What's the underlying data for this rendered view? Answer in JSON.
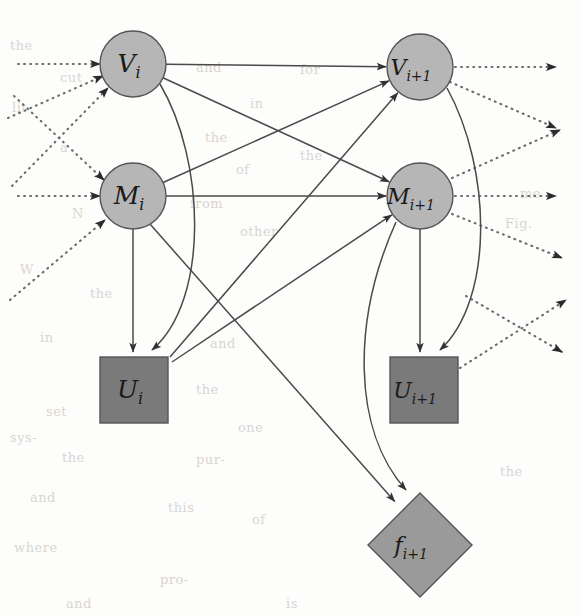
{
  "figure": {
    "background_color": "#fdfdfc",
    "colors": {
      "chance_node_fill": "#b6b6b6",
      "decision_node_fill": "#7a7a7a",
      "utility_node_fill": "#9a9a9a",
      "node_stroke": "#555555",
      "solid_edge": "#4a4a4a",
      "dotted_edge": "#6b6b6b",
      "label_text": "#1a1a1a",
      "bleed_text": "#d9d6d0"
    },
    "nodes": [
      {
        "id": "V_i",
        "label": "V",
        "sub": "i",
        "shape": "circle",
        "cx": 133,
        "cy": 64,
        "r": 33,
        "fill_key": "chance_node_fill"
      },
      {
        "id": "V_i1",
        "label": "V",
        "sub": "i+1",
        "shape": "circle",
        "cx": 420,
        "cy": 67,
        "r": 33,
        "fill_key": "chance_node_fill"
      },
      {
        "id": "M_i",
        "label": "M",
        "sub": "i",
        "shape": "circle",
        "cx": 133,
        "cy": 196,
        "r": 33,
        "fill_key": "chance_node_fill"
      },
      {
        "id": "M_i1",
        "label": "M",
        "sub": "i+1",
        "shape": "circle",
        "cx": 420,
        "cy": 196,
        "r": 33,
        "fill_key": "chance_node_fill"
      },
      {
        "id": "U_i",
        "label": "U",
        "sub": "i",
        "shape": "square",
        "x": 100,
        "y": 357,
        "w": 68,
        "h": 66,
        "fill_key": "decision_node_fill"
      },
      {
        "id": "U_i1",
        "label": "U",
        "sub": "i+1",
        "shape": "square",
        "x": 390,
        "y": 357,
        "w": 68,
        "h": 66,
        "fill_key": "decision_node_fill"
      },
      {
        "id": "f_i1",
        "label": "f",
        "sub": "i+1",
        "shape": "diamond",
        "cx": 420,
        "cy": 545,
        "rx": 52,
        "ry": 52,
        "fill_key": "utility_node_fill"
      }
    ],
    "edges": [
      {
        "from": "V_i",
        "to": "V_i1",
        "style": "solid"
      },
      {
        "from": "V_i",
        "to": "M_i1",
        "style": "solid"
      },
      {
        "from": "M_i",
        "to": "V_i1",
        "style": "solid"
      },
      {
        "from": "M_i",
        "to": "M_i1",
        "style": "solid"
      },
      {
        "from": "M_i",
        "to": "U_i",
        "style": "solid"
      },
      {
        "from": "V_i",
        "to": "U_i",
        "style": "solid"
      },
      {
        "from": "U_i",
        "to": "V_i1",
        "style": "solid"
      },
      {
        "from": "U_i",
        "to": "M_i1",
        "style": "solid"
      },
      {
        "from": "M_i1",
        "to": "U_i1",
        "style": "solid"
      },
      {
        "from": "V_i1",
        "to": "U_i1",
        "style": "solid"
      },
      {
        "from": "M_i1",
        "to": "f_i1",
        "style": "solid"
      },
      {
        "from": "M_i",
        "to": "f_i1",
        "style": "solid"
      },
      {
        "from": "external",
        "to": "V_i",
        "style": "dotted"
      },
      {
        "from": "external",
        "to": "M_i",
        "style": "dotted"
      },
      {
        "from": "V_i1",
        "to": "external",
        "style": "dotted"
      },
      {
        "from": "M_i1",
        "to": "external",
        "style": "dotted"
      },
      {
        "from": "U_i1",
        "to": "external",
        "style": "dotted"
      }
    ],
    "incoming_dotted_count": 6,
    "outgoing_dotted_count": 7,
    "bleed_text": [
      {
        "text": "the",
        "x": 10,
        "y": 38
      },
      {
        "text": "cut",
        "x": 60,
        "y": 70
      },
      {
        "text": "lit-",
        "x": 12,
        "y": 100
      },
      {
        "text": "and",
        "x": 196,
        "y": 60
      },
      {
        "text": "for",
        "x": 300,
        "y": 62
      },
      {
        "text": "in",
        "x": 250,
        "y": 96
      },
      {
        "text": "the",
        "x": 205,
        "y": 130
      },
      {
        "text": "a",
        "x": 60,
        "y": 140
      },
      {
        "text": "of",
        "x": 236,
        "y": 162
      },
      {
        "text": "the",
        "x": 300,
        "y": 148
      },
      {
        "text": "from",
        "x": 190,
        "y": 196
      },
      {
        "text": "N",
        "x": 72,
        "y": 206
      },
      {
        "text": "other",
        "x": 240,
        "y": 224
      },
      {
        "text": "me",
        "x": 520,
        "y": 186
      },
      {
        "text": "Fig.",
        "x": 505,
        "y": 216
      },
      {
        "text": "W",
        "x": 20,
        "y": 262
      },
      {
        "text": "the",
        "x": 90,
        "y": 286
      },
      {
        "text": "in",
        "x": 40,
        "y": 330
      },
      {
        "text": "and",
        "x": 210,
        "y": 336
      },
      {
        "text": "the",
        "x": 196,
        "y": 382
      },
      {
        "text": "set",
        "x": 46,
        "y": 404
      },
      {
        "text": "one",
        "x": 238,
        "y": 420
      },
      {
        "text": "sys-",
        "x": 10,
        "y": 430
      },
      {
        "text": "the",
        "x": 62,
        "y": 450
      },
      {
        "text": "pur-",
        "x": 196,
        "y": 452
      },
      {
        "text": "and",
        "x": 30,
        "y": 490
      },
      {
        "text": "this",
        "x": 168,
        "y": 500
      },
      {
        "text": "of",
        "x": 252,
        "y": 512
      },
      {
        "text": "the",
        "x": 500,
        "y": 464
      },
      {
        "text": "where",
        "x": 14,
        "y": 540
      },
      {
        "text": "pro-",
        "x": 160,
        "y": 572
      },
      {
        "text": "and",
        "x": 66,
        "y": 596
      },
      {
        "text": "is",
        "x": 286,
        "y": 596
      }
    ]
  }
}
